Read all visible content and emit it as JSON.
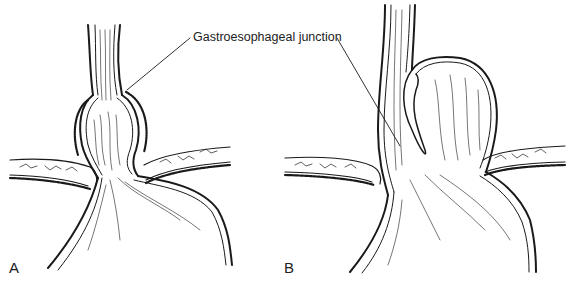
{
  "figure": {
    "callout_label": "Gastroesophageal junction",
    "panels": [
      {
        "id": "A",
        "label": "A",
        "description": "Sliding hiatal hernia: gastroesophageal junction displaced above the diaphragm"
      },
      {
        "id": "B",
        "label": "B",
        "description": "Paraesophageal hiatal hernia: gastric fundus herniates alongside the esophagus while junction remains at the diaphragm"
      }
    ],
    "colors": {
      "line": "#1a1a1a",
      "background": "#ffffff"
    }
  }
}
